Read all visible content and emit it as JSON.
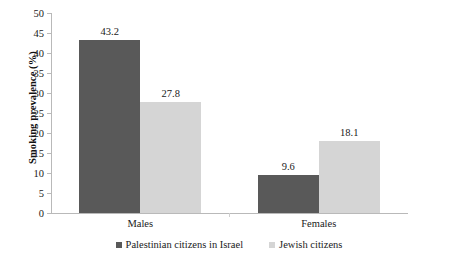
{
  "chart_data": {
    "type": "bar",
    "title": "",
    "xlabel": "",
    "ylabel": "Smoking prevalence (%)",
    "categories": [
      "Males",
      "Females"
    ],
    "series": [
      {
        "name": "Palestinian citizens in Israel",
        "color": "#595959",
        "values": [
          43.2,
          9.6
        ],
        "labels": [
          "43.2",
          "9.6"
        ]
      },
      {
        "name": "Jewish citizens",
        "color": "#d5d5d5",
        "values": [
          27.8,
          18.1
        ],
        "labels": [
          "27.8",
          "18.1"
        ]
      }
    ],
    "ylim": [
      0,
      50
    ],
    "yticks": [
      0,
      5,
      10,
      15,
      20,
      25,
      30,
      35,
      40,
      45,
      50
    ],
    "ytick_labels": [
      "0",
      "5",
      "10",
      "15",
      "20",
      "25",
      "30",
      "35",
      "40",
      "45",
      "50"
    ],
    "grid": false,
    "legend_position": "bottom"
  },
  "axis": {
    "y_title": "Smoking prevalence (%)"
  },
  "legend": {
    "items": [
      {
        "label": "Palestinian citizens in Israel"
      },
      {
        "label": "Jewish citizens"
      }
    ]
  }
}
